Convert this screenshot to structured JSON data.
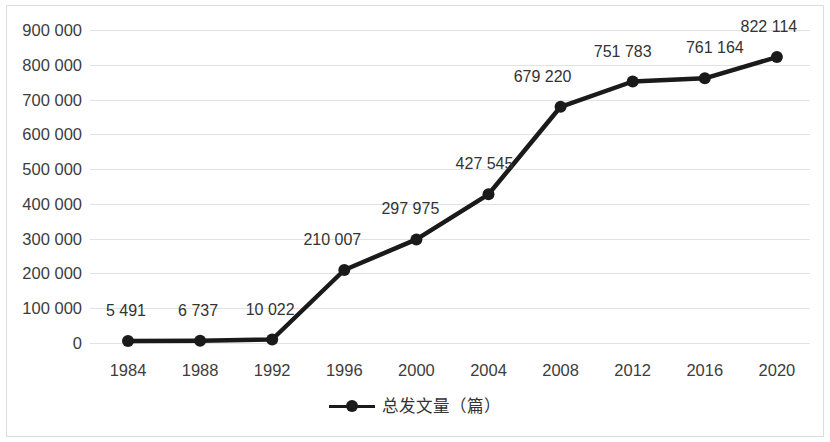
{
  "chart_data": {
    "type": "line",
    "title": "",
    "subtitle": "",
    "xlabel": "",
    "ylabel": "",
    "categories": [
      "1984",
      "1988",
      "1992",
      "1996",
      "2000",
      "2004",
      "2008",
      "2012",
      "2016",
      "2020"
    ],
    "values": [
      5491,
      6737,
      10022,
      210007,
      297975,
      427545,
      679220,
      751783,
      761164,
      822114
    ],
    "point_labels": [
      "5 491",
      "6 737",
      "10 022",
      "210 007",
      "297 975",
      "427 545",
      "679 220",
      "751 783",
      "761 164",
      "822 114"
    ],
    "series": [
      {
        "name": "总发文量（篇）",
        "values": [
          5491,
          6737,
          10022,
          210007,
          297975,
          427545,
          679220,
          751783,
          761164,
          822114
        ]
      }
    ],
    "ylim": [
      0,
      900000
    ],
    "y_ticks": [
      0,
      100000,
      200000,
      300000,
      400000,
      500000,
      600000,
      700000,
      800000,
      900000
    ],
    "y_tick_labels": [
      "0",
      "100 000",
      "200 000",
      "300 000",
      "400 000",
      "500 000",
      "600 000",
      "700 000",
      "800 000",
      "900 000"
    ],
    "grid": true,
    "legend_position": "bottom",
    "line_color": "#1a1a1a",
    "marker_color": "#1a1a1a",
    "gridline_color": "#e2e2e2",
    "background_color": "#ffffff",
    "border_color": "#dddddd"
  },
  "legend": {
    "entries": [
      {
        "label": "总发文量（篇）",
        "marker": "line-with-dot-marker"
      }
    ]
  }
}
